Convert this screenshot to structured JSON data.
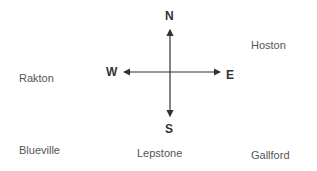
{
  "compass": {
    "north": "N",
    "south": "S",
    "east": "E",
    "west": "W"
  },
  "towns": {
    "hoston": "Hoston",
    "rakton": "Rakton",
    "blueville": "Blueville",
    "lepstone": "Lepstone",
    "gallford": "Gallford"
  },
  "colors": {
    "arrow": "#333333",
    "town_text": "#555555"
  }
}
